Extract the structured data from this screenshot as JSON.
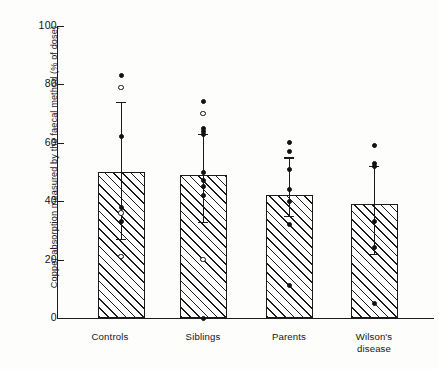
{
  "chart_data": {
    "type": "bar",
    "title": "",
    "subtitle": "",
    "xlabel": "",
    "ylabel": "Copper absorption measured by the faecal method (% of dose)",
    "categories": [
      "Controls",
      "Siblings",
      "Parents",
      "Wilson's disease"
    ],
    "values": [
      50,
      49,
      42,
      39
    ],
    "ylim": [
      0,
      100
    ],
    "yticks": [
      0,
      20,
      40,
      60,
      80,
      100
    ],
    "ytick_labels": [
      "0",
      "20",
      "40",
      "60",
      "80",
      "100"
    ],
    "grid": false,
    "legend": null,
    "legend_position": "none",
    "bar_style": "diagonal-hatch",
    "error_bars": {
      "direction": "upper-and-lower",
      "upper": [
        74,
        63,
        55,
        52
      ],
      "lower": [
        27,
        33,
        35,
        22
      ]
    },
    "series": [
      {
        "name": "Controls",
        "category": "Controls",
        "mean": 50,
        "points_filled": [
          83,
          62,
          38,
          33
        ],
        "points_open": [
          79,
          36,
          21
        ]
      },
      {
        "name": "Siblings",
        "category": "Siblings",
        "mean": 49,
        "points_filled": [
          74,
          65,
          64,
          63,
          50,
          47,
          45,
          42,
          0
        ],
        "points_open": [
          70,
          20
        ]
      },
      {
        "name": "Parents",
        "category": "Parents",
        "mean": 42,
        "points_filled": [
          60,
          57,
          51,
          44,
          40,
          32,
          11
        ],
        "points_open": []
      },
      {
        "name": "Wilson's disease",
        "category": "Wilson's disease",
        "mean": 39,
        "points_filled": [
          59,
          53,
          52,
          33,
          24,
          5
        ],
        "points_open": []
      }
    ],
    "colors": {
      "axis": "#1a1a1a",
      "bar_edge": "#1a1a1a",
      "bar_hatch": "#1a1a1a",
      "point_filled": "#111111",
      "point_open": "#ffffff",
      "background": "#fdfdfc"
    }
  },
  "axis": {
    "y_title": "Copper absorption measured by the faecal method (% of dose)",
    "y_ticks": [
      "100",
      "80",
      "60",
      "40",
      "20",
      "0"
    ]
  },
  "categories": {
    "c0_line1": "Controls",
    "c0_line2": "",
    "c1_line1": "Siblings",
    "c1_line2": "",
    "c2_line1": "Parents",
    "c2_line2": "",
    "c3_line1": "Wilson's",
    "c3_line2": "disease"
  }
}
